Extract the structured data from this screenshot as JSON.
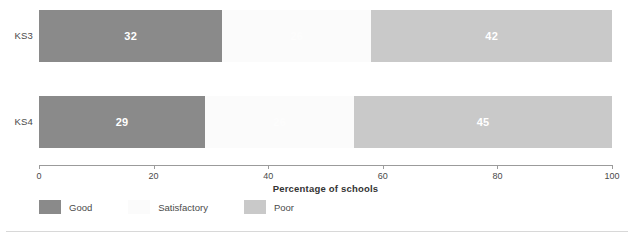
{
  "chart_data": {
    "type": "bar",
    "orientation": "horizontal",
    "stacked": true,
    "title": "",
    "xlabel": "Percentage of schools",
    "ylabel": "",
    "xlim": [
      0,
      100
    ],
    "xticks": [
      0,
      20,
      40,
      60,
      80,
      100
    ],
    "xtick_labels": [
      "0",
      "20",
      "40",
      "60",
      "80",
      "100"
    ],
    "grid": false,
    "legend_position": "bottom-left",
    "categories": [
      "KS3",
      "KS4"
    ],
    "series": [
      {
        "name": "Good",
        "color": "#8a8a8a",
        "values": [
          32,
          29
        ]
      },
      {
        "name": "Satisfactory",
        "color": "#fbfbfb",
        "values": [
          26,
          26
        ]
      },
      {
        "name": "Poor",
        "color": "#c9c9c9",
        "values": [
          42,
          45
        ]
      }
    ],
    "bars": [
      {
        "category": "KS3",
        "segments": [
          {
            "series": "Good",
            "value": 32,
            "label": "32"
          },
          {
            "series": "Satisfactory",
            "value": 26,
            "label": "26"
          },
          {
            "series": "Poor",
            "value": 42,
            "label": "42"
          }
        ]
      },
      {
        "category": "KS4",
        "segments": [
          {
            "series": "Good",
            "value": 29,
            "label": "29"
          },
          {
            "series": "Satisfactory",
            "value": 26,
            "label": "26"
          },
          {
            "series": "Poor",
            "value": 45,
            "label": "45"
          }
        ]
      }
    ]
  },
  "axis": {
    "title": "Percentage of schools",
    "ticks": [
      {
        "value": 0,
        "label": "0"
      },
      {
        "value": 20,
        "label": "20"
      },
      {
        "value": 40,
        "label": "40"
      },
      {
        "value": 60,
        "label": "60"
      },
      {
        "value": 80,
        "label": "80"
      },
      {
        "value": 100,
        "label": "100"
      }
    ]
  },
  "rows": [
    {
      "label": "KS3"
    },
    {
      "label": "KS4"
    }
  ],
  "legend": {
    "items": [
      {
        "label": "Good",
        "color": "#8a8a8a"
      },
      {
        "label": "Satisfactory",
        "color": "#fbfbfb"
      },
      {
        "label": "Poor",
        "color": "#c9c9c9"
      }
    ]
  }
}
